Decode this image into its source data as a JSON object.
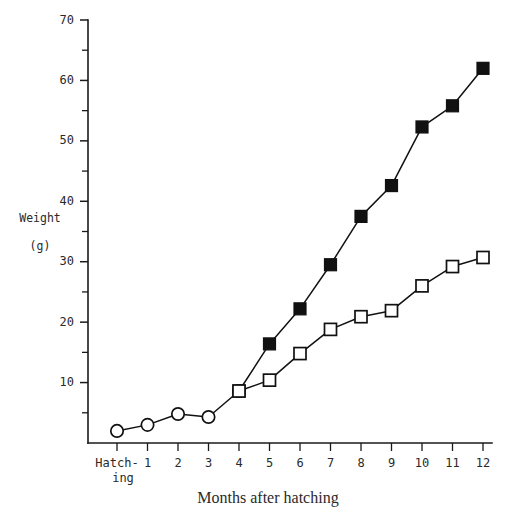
{
  "chart_data": {
    "type": "line",
    "title": "",
    "xlabel": "Months after hatching",
    "ylabel_line1": "Weight",
    "ylabel_line2": "(g)",
    "x_categories": [
      "Hatch-\ning",
      "1",
      "2",
      "3",
      "4",
      "5",
      "6",
      "7",
      "8",
      "9",
      "10",
      "11",
      "12"
    ],
    "x_tick_labels": [
      "Hatch-",
      "1",
      "2",
      "3",
      "4",
      "5",
      "6",
      "7",
      "8",
      "9",
      "10",
      "11",
      "12"
    ],
    "x_tick_label_second_line": "ing",
    "x_values": [
      0,
      1,
      2,
      3,
      4,
      5,
      6,
      7,
      8,
      9,
      10,
      11,
      12
    ],
    "xlim": [
      0,
      12
    ],
    "ylim": [
      0,
      70
    ],
    "y_tick_labels": [
      "10",
      "20",
      "30",
      "40",
      "50",
      "60",
      "70"
    ],
    "y_ticks_major": [
      10,
      20,
      30,
      40,
      50,
      60,
      70
    ],
    "y_ticks_minor": [
      5,
      15,
      25,
      35,
      45,
      55,
      65
    ],
    "grid": false,
    "legend": "none",
    "series": [
      {
        "name": "open-circle-series",
        "marker": "open-circle",
        "x": [
          0,
          1,
          2,
          3,
          4
        ],
        "values": [
          2.0,
          3.0,
          4.8,
          4.3,
          8.6
        ]
      },
      {
        "name": "filled-square-series",
        "marker": "filled-square",
        "x": [
          4,
          5,
          6,
          7,
          8,
          9,
          10,
          11,
          12
        ],
        "values": [
          8.6,
          16.4,
          22.2,
          29.5,
          37.5,
          42.6,
          52.3,
          55.8,
          62.0
        ]
      },
      {
        "name": "open-square-series",
        "marker": "open-square",
        "x": [
          4,
          5,
          6,
          7,
          8,
          9,
          10,
          11,
          12
        ],
        "values": [
          8.6,
          10.4,
          14.8,
          18.8,
          20.9,
          21.9,
          26.0,
          29.2,
          30.7
        ]
      }
    ]
  },
  "colors": {
    "ink": "#111111",
    "text": "#2a2a2a",
    "background": "#ffffff"
  }
}
